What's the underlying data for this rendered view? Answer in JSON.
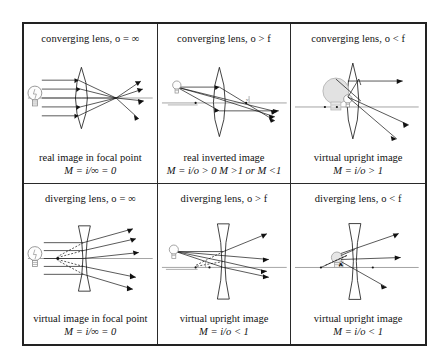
{
  "figure": {
    "name": "lens-ray-diagram-table",
    "rows": 2,
    "columns": 3,
    "border_color": "#222222",
    "background": "#ffffff",
    "ray_color": "#111111",
    "object_color": "#8d8d8d",
    "image_color": "#9a9a9a"
  },
  "cells": [
    {
      "id": "converging-infinite",
      "title": "converging lens, o = ∞",
      "lens_type": "converging",
      "object_distance": "infinite",
      "caption_line1": "real image in focal point",
      "caption_line2": "M = i/∞ = 0",
      "object": "light-bulb",
      "rays": "parallel-rays-converging-to-focal-point"
    },
    {
      "id": "converging-beyond-f",
      "title": "converging lens, o > f",
      "lens_type": "converging",
      "object_distance": "greater-than-focal-length",
      "caption_line1": "real  inverted image",
      "caption_line2": "M = i/o > 0 M >1 or M <1",
      "object": "light-bulb",
      "rays": "three-rays-forming-real-inverted-image"
    },
    {
      "id": "converging-within-f",
      "title": "converging lens, o < f",
      "lens_type": "converging",
      "object_distance": "less-than-focal-length",
      "caption_line1": "virtual upright image",
      "caption_line2": "M = i/o > 1",
      "object": "light-bulb",
      "rays": "diverging-rays-forming-magnified-virtual-image"
    },
    {
      "id": "diverging-infinite",
      "title": "diverging lens, o = ∞",
      "lens_type": "diverging",
      "object_distance": "infinite",
      "caption_line1": "virtual image in focal point",
      "caption_line2": "M = i/∞ = 0",
      "object": "light-bulb",
      "rays": "parallel-rays-diverging-from-virtual-focal-point"
    },
    {
      "id": "diverging-beyond-f",
      "title": "diverging lens, o > f",
      "lens_type": "diverging",
      "object_distance": "greater-than-focal-length",
      "caption_line1": "virtual upright image",
      "caption_line2": "M = i/o < 1",
      "object": "light-bulb",
      "rays": "three-rays-forming-reduced-virtual-image"
    },
    {
      "id": "diverging-within-f",
      "title": "diverging lens, o < f",
      "lens_type": "diverging",
      "object_distance": "less-than-focal-length",
      "caption_line1": "virtual upright image",
      "caption_line2": "M = i/o < 1",
      "object": "light-bulb",
      "rays": "three-rays-forming-slightly-reduced-virtual-image"
    }
  ],
  "labels": {
    "optical_axis": "optical-axis",
    "focal_point_near": "F",
    "focal_point_far": "F"
  }
}
